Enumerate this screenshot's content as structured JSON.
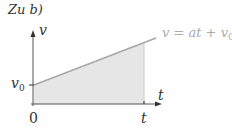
{
  "title": "Zu b)",
  "diagram": {
    "y_axis_label": "v",
    "x_axis_label": "t",
    "y_intercept_label": "v",
    "y_intercept_subscript": "0",
    "origin_label": "0",
    "t_tick_label": "t",
    "line_equation": "v = at + v",
    "line_equation_subscript": "0",
    "colors": {
      "axis": "#333333",
      "line": "#a8a8a8",
      "fill": "#e6e6e6",
      "equation_text": "#aaaaaa"
    }
  }
}
